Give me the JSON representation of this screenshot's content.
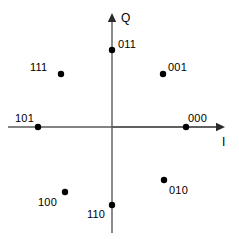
{
  "chart_data": {
    "type": "scatter",
    "title": "",
    "subtitle": "",
    "xlabel": "I",
    "ylabel": "Q",
    "grid": false,
    "legend": "none",
    "xlim": [
      -1.4,
      1.5
    ],
    "ylim": [
      -1.5,
      1.55
    ],
    "annotations": [],
    "series": [
      {
        "name": "8-PSK constellation points",
        "points": [
          {
            "label": "000",
            "x": 1.0,
            "y": 0.0,
            "px": 186,
            "py": 127,
            "label_px": 188,
            "label_py": 113
          },
          {
            "label": "001",
            "x": 0.707,
            "y": 0.707,
            "px": 163,
            "py": 74,
            "label_px": 168,
            "label_py": 62
          },
          {
            "label": "011",
            "x": 0.0,
            "y": 1.0,
            "px": 112,
            "py": 50,
            "label_px": 118,
            "label_py": 39
          },
          {
            "label": "111",
            "x": -0.707,
            "y": 0.707,
            "px": 61,
            "py": 74,
            "label_px": 30,
            "label_py": 62
          },
          {
            "label": "101",
            "x": -1.0,
            "y": 0.0,
            "px": 38,
            "py": 127,
            "label_px": 15,
            "label_py": 113
          },
          {
            "label": "100",
            "x": -0.707,
            "y": -0.707,
            "px": 65,
            "py": 192,
            "label_px": 38,
            "label_py": 197
          },
          {
            "label": "110",
            "x": 0.0,
            "y": -1.0,
            "px": 112,
            "py": 205,
            "label_px": 87,
            "label_py": 209
          },
          {
            "label": "010",
            "x": 0.707,
            "y": -0.707,
            "px": 164,
            "py": 180,
            "label_px": 169,
            "label_py": 185
          }
        ]
      }
    ],
    "axes": {
      "origin_px": {
        "x": 112,
        "y": 127
      },
      "i_axis": {
        "x_start": 8,
        "x_end": 225,
        "y": 127,
        "arrow": "right"
      },
      "q_axis": {
        "y_start": 13,
        "y_end": 233,
        "x": 112,
        "arrow": "up"
      },
      "i_label_px": {
        "x": 222,
        "y": 136
      },
      "q_label_px": {
        "x": 121,
        "y": 12
      }
    },
    "colors": {
      "point": "#000000",
      "axis": "#5a5a5a",
      "axis_dark": "#2b2b2b",
      "text": "#000000",
      "background": "#ffffff"
    },
    "point_radius_px": 3.2
  }
}
